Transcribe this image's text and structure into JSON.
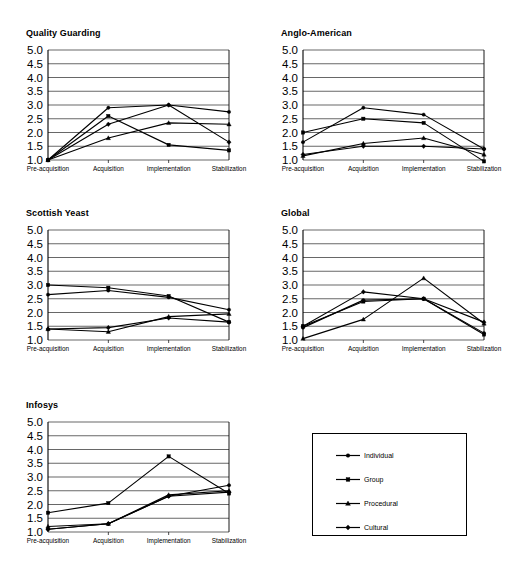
{
  "figure": {
    "categories": [
      "Pre-acquisition",
      "Acquisition",
      "Implementation",
      "Stabilization"
    ],
    "y_ticks": [
      "5.0",
      "4.5",
      "4.0",
      "3.5",
      "3.0",
      "2.5",
      "2.0",
      "1.5",
      "1.0"
    ],
    "series_names": [
      "Individual",
      "Group",
      "Procedural",
      "Cultural"
    ],
    "legend": {
      "name": "series-legend",
      "entries": [
        {
          "label": "Individual",
          "marker": "circle"
        },
        {
          "label": "Group",
          "marker": "square"
        },
        {
          "label": "Procedural",
          "marker": "triangle"
        },
        {
          "label": "Cultural",
          "marker": "diamond"
        }
      ]
    }
  },
  "chart_data": [
    {
      "type": "line",
      "title": "Quality Guarding",
      "xlabel": "",
      "ylabel": "",
      "ylim": [
        1.0,
        5.0
      ],
      "grid": true,
      "legend_position": "external-bottom-right",
      "categories": [
        "Pre-acquisition",
        "Acquisition",
        "Implementation",
        "Stabilization"
      ],
      "series": [
        {
          "name": "Individual",
          "marker": "circle",
          "values": [
            1.0,
            2.9,
            3.0,
            2.75
          ]
        },
        {
          "name": "Group",
          "marker": "square",
          "values": [
            1.0,
            2.6,
            1.55,
            1.35
          ]
        },
        {
          "name": "Procedural",
          "marker": "triangle",
          "values": [
            1.0,
            1.8,
            2.35,
            2.3
          ]
        },
        {
          "name": "Cultural",
          "marker": "diamond",
          "values": [
            1.0,
            2.3,
            3.0,
            1.65
          ]
        }
      ]
    },
    {
      "type": "line",
      "title": "Anglo-American",
      "xlabel": "",
      "ylabel": "",
      "ylim": [
        1.0,
        5.0
      ],
      "grid": true,
      "legend_position": "external-bottom-right",
      "categories": [
        "Pre-acquisition",
        "Acquisition",
        "Implementation",
        "Stabilization"
      ],
      "series": [
        {
          "name": "Individual",
          "marker": "circle",
          "values": [
            1.65,
            2.9,
            2.65,
            1.4
          ]
        },
        {
          "name": "Group",
          "marker": "square",
          "values": [
            2.0,
            2.5,
            2.35,
            0.95
          ]
        },
        {
          "name": "Procedural",
          "marker": "triangle",
          "values": [
            1.15,
            1.6,
            1.8,
            1.2
          ]
        },
        {
          "name": "Cultural",
          "marker": "diamond",
          "values": [
            1.2,
            1.5,
            1.5,
            1.4
          ]
        }
      ]
    },
    {
      "type": "line",
      "title": "Scottish Yeast",
      "xlabel": "",
      "ylabel": "",
      "ylim": [
        1.0,
        5.0
      ],
      "grid": true,
      "legend_position": "external-bottom-right",
      "categories": [
        "Pre-acquisition",
        "Acquisition",
        "Implementation",
        "Stabilization"
      ],
      "series": [
        {
          "name": "Individual",
          "marker": "circle",
          "values": [
            2.65,
            2.8,
            2.55,
            2.1
          ]
        },
        {
          "name": "Group",
          "marker": "square",
          "values": [
            3.0,
            2.9,
            2.6,
            1.65
          ]
        },
        {
          "name": "Procedural",
          "marker": "triangle",
          "values": [
            1.4,
            1.3,
            1.85,
            1.95
          ]
        },
        {
          "name": "Cultural",
          "marker": "diamond",
          "values": [
            1.4,
            1.45,
            1.8,
            1.65
          ]
        }
      ]
    },
    {
      "type": "line",
      "title": "Global",
      "xlabel": "",
      "ylabel": "",
      "ylim": [
        1.0,
        5.0
      ],
      "grid": true,
      "legend_position": "external-bottom-right",
      "categories": [
        "Pre-acquisition",
        "Acquisition",
        "Implementation",
        "Stabilization"
      ],
      "series": [
        {
          "name": "Individual",
          "marker": "circle",
          "values": [
            1.45,
            2.45,
            2.5,
            1.25
          ]
        },
        {
          "name": "Group",
          "marker": "square",
          "values": [
            1.5,
            2.4,
            2.5,
            1.2
          ]
        },
        {
          "name": "Procedural",
          "marker": "triangle",
          "values": [
            1.05,
            1.75,
            3.25,
            1.6
          ]
        },
        {
          "name": "Cultural",
          "marker": "diamond",
          "values": [
            1.5,
            2.75,
            2.5,
            1.65
          ]
        }
      ]
    },
    {
      "type": "line",
      "title": "Infosys",
      "xlabel": "",
      "ylabel": "",
      "ylim": [
        1.0,
        5.0
      ],
      "grid": true,
      "legend_position": "external-bottom-right",
      "categories": [
        "Pre-acquisition",
        "Acquisition",
        "Implementation",
        "Stabilization"
      ],
      "series": [
        {
          "name": "Individual",
          "marker": "circle",
          "values": [
            1.1,
            1.3,
            2.3,
            2.7
          ]
        },
        {
          "name": "Group",
          "marker": "square",
          "values": [
            1.7,
            2.05,
            3.75,
            2.4
          ]
        },
        {
          "name": "Procedural",
          "marker": "triangle",
          "values": [
            1.2,
            1.3,
            2.35,
            2.5
          ]
        },
        {
          "name": "Cultural",
          "marker": "diamond",
          "values": [
            1.1,
            1.3,
            2.3,
            2.45
          ]
        }
      ]
    }
  ]
}
